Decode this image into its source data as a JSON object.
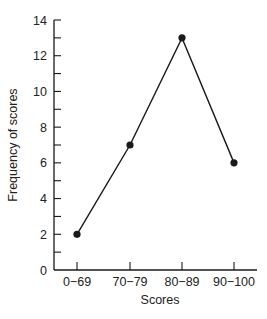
{
  "chart_data": {
    "type": "line",
    "title": "",
    "xlabel": "Scores",
    "ylabel": "Frequency of scores",
    "categories": [
      "0−69",
      "70−79",
      "80−89",
      "90−100"
    ],
    "values": [
      2,
      7,
      13,
      6
    ],
    "ylim": [
      0,
      14
    ],
    "yticks": [
      0,
      2,
      4,
      6,
      8,
      10,
      12,
      14
    ],
    "grid": false,
    "legend": null,
    "markers": "filled-circle",
    "color": "#1a1a1a"
  }
}
